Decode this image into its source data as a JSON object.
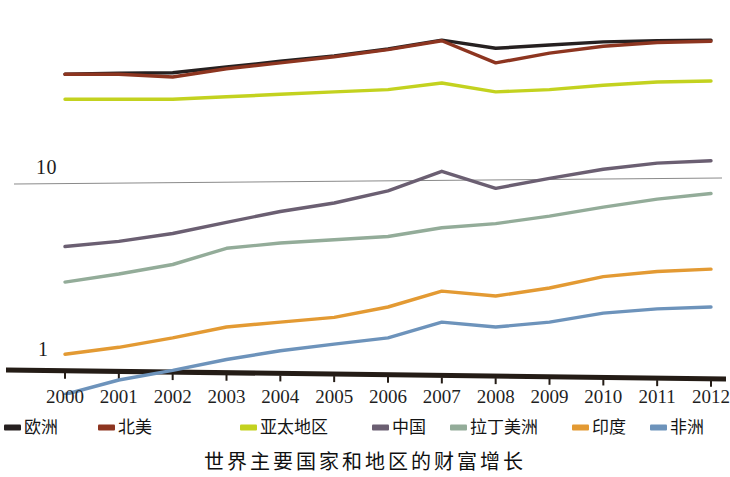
{
  "caption": "世界主要国家和地区的财富增长",
  "axis": {
    "y_tick_labels": [
      "10",
      "1"
    ],
    "x_tick_labels": [
      "2000",
      "2001",
      "2002",
      "2003",
      "2004",
      "2005",
      "2006",
      "2007",
      "2008",
      "2009",
      "2010",
      "2011",
      "2012"
    ]
  },
  "legend": {
    "items": [
      {
        "label": "欧洲",
        "color": "#262020"
      },
      {
        "label": "北美",
        "color": "#8d3520"
      },
      {
        "label": "亚太地区",
        "color": "#c3d21f"
      },
      {
        "label": "中国",
        "color": "#6b5f72"
      },
      {
        "label": "拉丁美洲",
        "color": "#93ac99"
      },
      {
        "label": "印度",
        "color": "#e39a33"
      },
      {
        "label": "非洲",
        "color": "#6d93bb"
      }
    ]
  },
  "chart_data": {
    "type": "line",
    "title": "世界主要国家和地区的财富增长",
    "xlabel": "",
    "ylabel": "",
    "yscale": "log",
    "ylim": [
      0.55,
      90
    ],
    "grid": true,
    "legend_position": "bottom",
    "x": [
      "2000",
      "2001",
      "2002",
      "2003",
      "2004",
      "2005",
      "2006",
      "2007",
      "2008",
      "2009",
      "2010",
      "2011",
      "2012"
    ],
    "series": [
      {
        "name": "欧洲",
        "color": "#262020",
        "values": [
          41.0,
          41.5,
          41.8,
          45.0,
          48.5,
          52.0,
          57.0,
          64.0,
          57.5,
          60.0,
          62.5,
          63.5,
          64.0
        ]
      },
      {
        "name": "北美",
        "color": "#8d3520",
        "values": [
          41.0,
          41.0,
          39.5,
          44.0,
          47.5,
          51.5,
          56.5,
          63.5,
          47.5,
          54.0,
          59.0,
          62.0,
          63.0
        ]
      },
      {
        "name": "亚太地区",
        "color": "#c3d21f",
        "values": [
          29.5,
          29.5,
          29.5,
          30.5,
          31.5,
          32.5,
          33.5,
          36.5,
          32.5,
          33.5,
          35.5,
          37.0,
          37.5
        ]
      },
      {
        "name": "中国",
        "color": "#6b5f72",
        "values": [
          4.3,
          4.6,
          5.1,
          5.9,
          6.8,
          7.6,
          8.9,
          11.5,
          9.2,
          10.5,
          11.8,
          12.8,
          13.2
        ]
      },
      {
        "name": "拉丁美洲",
        "color": "#93ac99",
        "values": [
          2.7,
          3.0,
          3.4,
          4.2,
          4.5,
          4.7,
          4.9,
          5.5,
          5.8,
          6.4,
          7.2,
          8.0,
          8.6
        ]
      },
      {
        "name": "印度",
        "color": "#e39a33",
        "values": [
          1.05,
          1.15,
          1.3,
          1.5,
          1.6,
          1.7,
          1.95,
          2.4,
          2.25,
          2.5,
          2.9,
          3.1,
          3.2
        ]
      },
      {
        "name": "非洲",
        "color": "#6d93bb",
        "values": [
          0.62,
          0.75,
          0.85,
          0.98,
          1.1,
          1.2,
          1.3,
          1.6,
          1.5,
          1.6,
          1.8,
          1.9,
          1.95
        ]
      }
    ]
  }
}
